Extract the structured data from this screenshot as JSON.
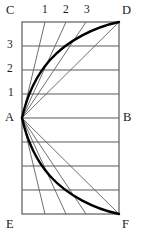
{
  "figure": {
    "colors": {
      "background": "#ffffff",
      "frame": "#4d4d4d",
      "gridline": "#5a5a5a",
      "thin_line": "#555555",
      "curve": "#000000",
      "label": "#1a1a1a"
    },
    "corner_labels": [
      {
        "name": "C",
        "text": "C",
        "x": 6,
        "y": 4
      },
      {
        "name": "D",
        "text": "D",
        "x": 122,
        "y": 4
      },
      {
        "name": "E",
        "text": "E",
        "x": 6,
        "y": 218
      },
      {
        "name": "F",
        "text": "F",
        "x": 122,
        "y": 218
      },
      {
        "name": "A",
        "text": "A",
        "x": 5,
        "y": 111
      },
      {
        "name": "B",
        "text": "B",
        "x": 123,
        "y": 111
      }
    ],
    "top_tick_labels": [
      {
        "name": "top-1",
        "text": "1",
        "x": 42,
        "y": 4
      },
      {
        "name": "top-2",
        "text": "2",
        "x": 63,
        "y": 4
      },
      {
        "name": "top-3",
        "text": "3",
        "x": 84,
        "y": 4
      }
    ],
    "left_tick_labels": [
      {
        "name": "left-3",
        "text": "3",
        "x": 7,
        "y": 39
      },
      {
        "name": "left-2",
        "text": "2",
        "x": 7,
        "y": 63
      },
      {
        "name": "left-1",
        "text": "1",
        "x": 8,
        "y": 87
      }
    ],
    "geometry": {
      "rect": {
        "left": 22,
        "top": 22,
        "right": 119,
        "bottom": 214
      },
      "point_A": {
        "x": 22,
        "y": 118
      },
      "point_B": {
        "x": 119,
        "y": 118
      },
      "point_D": {
        "x": 119,
        "y": 22
      },
      "point_F": {
        "x": 119,
        "y": 214
      },
      "gridline_y": [
        46,
        70,
        94,
        118,
        142,
        166,
        190
      ],
      "chord_top_endpoints_x": [
        45,
        66,
        86
      ],
      "chord_bottom_endpoints_x": [
        45,
        66,
        86
      ],
      "fan_upper_targets": [
        {
          "x": 45,
          "y": 22
        },
        {
          "x": 66,
          "y": 22
        },
        {
          "x": 86,
          "y": 22
        },
        {
          "x": 119,
          "y": 22
        }
      ],
      "fan_lower_targets": [
        {
          "x": 45,
          "y": 214
        },
        {
          "x": 66,
          "y": 214
        },
        {
          "x": 86,
          "y": 214
        },
        {
          "x": 119,
          "y": 214
        }
      ],
      "curve_upper_path": "M22,118 C26,100 34,78 50,60 C68,40 95,27 119,22",
      "curve_lower_path": "M22,118 C26,136 34,158 50,176 C68,196 95,209 119,214"
    }
  }
}
